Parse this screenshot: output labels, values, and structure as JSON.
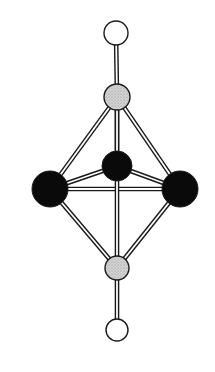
{
  "diagram": {
    "type": "ball-and-stick",
    "colors": {
      "black_atom": "#0a0a0a",
      "gray_atom": "#c8c8c8",
      "white_atom": "#ffffff",
      "outline": "#1a1a1a",
      "bond_fill": "#ffffff"
    },
    "atoms": [
      {
        "id": "top-terminal",
        "kind": "white",
        "cx": 116,
        "cy": 33,
        "r": 12
      },
      {
        "id": "top-apical",
        "kind": "gray",
        "cx": 117,
        "cy": 97,
        "r": 13
      },
      {
        "id": "eq-back",
        "kind": "black",
        "cx": 117,
        "cy": 166,
        "r": 15
      },
      {
        "id": "eq-left",
        "kind": "black",
        "cx": 50,
        "cy": 189,
        "r": 18
      },
      {
        "id": "eq-right",
        "kind": "black",
        "cx": 180,
        "cy": 189,
        "r": 18
      },
      {
        "id": "bottom-apical",
        "kind": "gray",
        "cx": 117,
        "cy": 268,
        "r": 12
      },
      {
        "id": "bottom-terminal",
        "kind": "white",
        "cx": 117,
        "cy": 330,
        "r": 11
      }
    ],
    "bonds": [
      [
        "top-terminal",
        "top-apical"
      ],
      [
        "top-apical",
        "eq-left"
      ],
      [
        "top-apical",
        "eq-right"
      ],
      [
        "top-apical",
        "eq-back"
      ],
      [
        "eq-back",
        "eq-left"
      ],
      [
        "eq-back",
        "eq-right"
      ],
      [
        "eq-left",
        "eq-right"
      ],
      [
        "eq-left",
        "bottom-apical"
      ],
      [
        "eq-right",
        "bottom-apical"
      ],
      [
        "top-apical",
        "bottom-apical"
      ],
      [
        "bottom-apical",
        "bottom-terminal"
      ]
    ]
  }
}
